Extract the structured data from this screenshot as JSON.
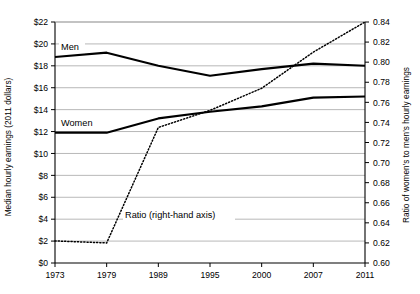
{
  "chart_data": {
    "type": "line",
    "title": "",
    "subtitle": "",
    "xlabel": "",
    "categories": [
      "1973",
      "1979",
      "1989",
      "1995",
      "2000",
      "2007",
      "2011"
    ],
    "grid": true,
    "legend_position": "inline-annotations",
    "left_axis": {
      "label": "Median hourly earnings (2011 dollars)",
      "ticks": [
        "$0",
        "$2",
        "$4",
        "$6",
        "$8",
        "$10",
        "$12",
        "$14",
        "$16",
        "$18",
        "$20",
        "$22"
      ],
      "tick_values": [
        0,
        2,
        4,
        6,
        8,
        10,
        12,
        14,
        16,
        18,
        20,
        22
      ],
      "ylim": [
        0,
        22
      ]
    },
    "right_axis": {
      "label": "Ratio of women's to men's hourly earnings",
      "ticks": [
        "0.60",
        "0.62",
        "0.64",
        "0.66",
        "0.68",
        "0.70",
        "0.72",
        "0.74",
        "0.76",
        "0.78",
        "0.80",
        "0.82",
        "0.84"
      ],
      "tick_values": [
        0.6,
        0.62,
        0.64,
        0.66,
        0.68,
        0.7,
        0.72,
        0.74,
        0.76,
        0.78,
        0.8,
        0.82,
        0.84
      ],
      "ylim": [
        0.6,
        0.84
      ]
    },
    "series": [
      {
        "name": "Men",
        "label": "Men",
        "axis": "left",
        "style": "solid",
        "values": [
          18.8,
          19.2,
          18.0,
          17.1,
          17.7,
          18.2,
          18.0
        ]
      },
      {
        "name": "Women",
        "label": "Women",
        "axis": "left",
        "style": "solid",
        "values": [
          11.9,
          11.9,
          13.2,
          13.8,
          14.3,
          15.1,
          15.2
        ]
      },
      {
        "name": "Ratio",
        "label": "Ratio (right-hand axis)",
        "axis": "right",
        "style": "dotted",
        "values": [
          0.622,
          0.62,
          0.735,
          0.752,
          0.774,
          0.81,
          0.84
        ]
      }
    ]
  }
}
